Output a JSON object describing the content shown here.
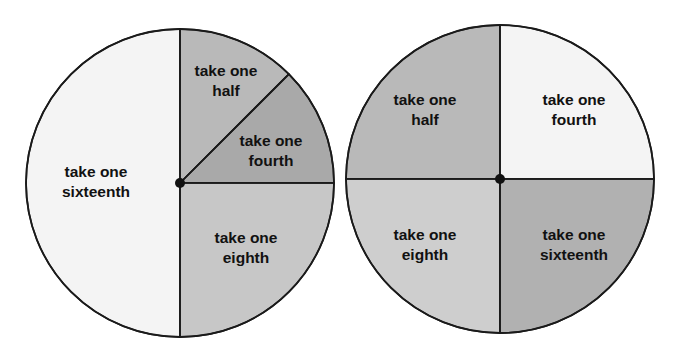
{
  "figure": {
    "background_color": "#ffffff",
    "outline_color": "#1a1a1a",
    "text_color": "#111111"
  },
  "chart_data": {
    "type": "pie",
    "xlabel": "",
    "ylabel": "",
    "grid": false,
    "legend": "none",
    "charts": [
      {
        "name": "left-circle",
        "center_x": 180,
        "center_y": 183,
        "radius": 154,
        "slices": [
          {
            "label_line1": "take one",
            "label_line2": "sixteenth",
            "fraction": 0.5,
            "degrees": 180,
            "start_angle_deg": 90,
            "end_angle_deg": 270,
            "color": "#f4f4f4",
            "label_x": 96,
            "label_y": 183
          },
          {
            "label_line1": "take one",
            "label_line2": "half",
            "fraction": 0.125,
            "degrees": 45,
            "start_angle_deg": 45,
            "end_angle_deg": 90,
            "color": "#b9b9b9",
            "label_x": 226,
            "label_y": 82
          },
          {
            "label_line1": "take one",
            "label_line2": "fourth",
            "fraction": 0.125,
            "degrees": 45,
            "start_angle_deg": 0,
            "end_angle_deg": 45,
            "color": "#a9a9a9",
            "label_x": 271,
            "label_y": 152
          },
          {
            "label_line1": "take one",
            "label_line2": "eighth",
            "fraction": 0.25,
            "degrees": 90,
            "start_angle_deg": -90,
            "end_angle_deg": 0,
            "color": "#c7c7c7",
            "label_x": 246,
            "label_y": 249
          }
        ]
      },
      {
        "name": "right-circle",
        "center_x": 500,
        "center_y": 179,
        "radius": 154,
        "slices": [
          {
            "label_line1": "take one",
            "label_line2": "half",
            "fraction": 0.25,
            "degrees": 90,
            "start_angle_deg": 90,
            "end_angle_deg": 180,
            "color": "#b9b9b9",
            "label_x": 425,
            "label_y": 111
          },
          {
            "label_line1": "take one",
            "label_line2": "fourth",
            "fraction": 0.25,
            "degrees": 90,
            "start_angle_deg": 0,
            "end_angle_deg": 90,
            "color": "#f4f4f4",
            "label_x": 574,
            "label_y": 111
          },
          {
            "label_line1": "take one",
            "label_line2": "eighth",
            "fraction": 0.25,
            "degrees": 90,
            "start_angle_deg": 180,
            "end_angle_deg": 270,
            "color": "#cecece",
            "label_x": 425,
            "label_y": 246
          },
          {
            "label_line1": "take one",
            "label_line2": "sixteenth",
            "fraction": 0.25,
            "degrees": 90,
            "start_angle_deg": -90,
            "end_angle_deg": 0,
            "color": "#b1b1b1",
            "label_x": 574,
            "label_y": 246
          }
        ]
      }
    ]
  }
}
